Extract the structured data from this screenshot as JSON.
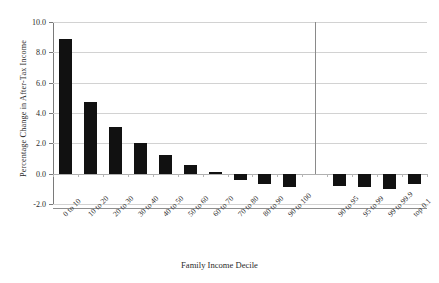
{
  "chart_data": {
    "type": "bar",
    "title": "",
    "xlabel": "Family Income Decile",
    "ylabel": "Percentage Change in After-Tax Income",
    "categories": [
      "0 to 10",
      "10 to 20",
      "20 to 30",
      "30 to 40",
      "40 to 50",
      "50 to 60",
      "60 to 70",
      "70 to 80",
      "80 to 90",
      "90 to 100",
      "90 to 95",
      "95 to 99",
      "99 to 99.9",
      "top 0.1"
    ],
    "values": [
      8.9,
      4.7,
      3.1,
      2.0,
      1.2,
      0.6,
      0.1,
      -0.4,
      -0.7,
      -0.9,
      -0.8,
      -0.9,
      -1.0,
      -0.7
    ],
    "ylim": [
      -2.0,
      10.0
    ],
    "ytick_labels": [
      "10.0",
      "8.0",
      "6.0",
      "4.0",
      "2.0",
      "0.0",
      "-2.0"
    ],
    "ytick_values": [
      10.0,
      8.0,
      6.0,
      4.0,
      2.0,
      0.0,
      -2.0
    ],
    "grid": true,
    "legend": "none",
    "bar_color": "#111111",
    "gridline_color": "#d2d2d2",
    "axis_color": "#7a7a7a",
    "separator_after_index": 9,
    "gap_slots": 1,
    "annotations": []
  }
}
